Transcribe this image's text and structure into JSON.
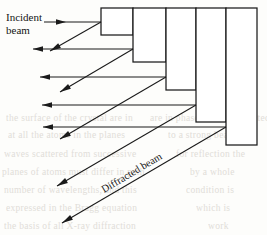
{
  "figure": {
    "type": "diffraction-schematic",
    "width": 267,
    "height": 235,
    "background_color": "#fdfdfb",
    "line_color": "#1a1a1a"
  },
  "labels": {
    "incident_line1": "Incident",
    "incident_line2": "beam",
    "diffracted": "Diffracted beam"
  },
  "crystal_steps": [
    {
      "name": "step-1",
      "x": 101,
      "y": 8,
      "width": 32,
      "height": 27
    },
    {
      "name": "step-2",
      "x": 133,
      "y": 8,
      "width": 33,
      "height": 54
    },
    {
      "name": "step-3",
      "x": 166,
      "y": 8,
      "width": 30,
      "height": 82
    },
    {
      "name": "step-4",
      "x": 196,
      "y": 8,
      "width": 30,
      "height": 114
    },
    {
      "name": "step-5",
      "x": 226,
      "y": 8,
      "width": 31,
      "height": 137
    }
  ],
  "step_corners": [
    {
      "x": 101,
      "y": 22
    },
    {
      "x": 133,
      "y": 49
    },
    {
      "x": 166,
      "y": 77
    },
    {
      "x": 196,
      "y": 105
    },
    {
      "x": 226,
      "y": 127
    }
  ],
  "incident_rays": [
    {
      "name": "incident-ray-1",
      "x1": 44,
      "y1": 22,
      "x2": 101,
      "y2": 22,
      "arrow": "right"
    },
    {
      "name": "incident-ray-2",
      "x1": 33,
      "y1": 49,
      "x2": 133,
      "y2": 49,
      "arrow": "left"
    },
    {
      "name": "incident-ray-3",
      "x1": 40,
      "y1": 77,
      "x2": 166,
      "y2": 77,
      "arrow": "left"
    },
    {
      "name": "incident-ray-4",
      "x1": 42,
      "y1": 105,
      "x2": 196,
      "y2": 105,
      "arrow": "left"
    },
    {
      "name": "incident-ray-5",
      "x1": 43,
      "y1": 127,
      "x2": 226,
      "y2": 127,
      "arrow": "left"
    }
  ],
  "diffracted_rays": [
    {
      "name": "diffracted-ray-1",
      "x1": 101,
      "y1": 22,
      "x2": 50,
      "y2": 51,
      "arrow": "down-left"
    },
    {
      "name": "diffracted-ray-2",
      "x1": 133,
      "y1": 49,
      "x2": 60,
      "y2": 92,
      "arrow": "down-left"
    },
    {
      "name": "diffracted-ray-3",
      "x1": 166,
      "y1": 77,
      "x2": 60,
      "y2": 139,
      "arrow": "down-left"
    },
    {
      "name": "diffracted-ray-4",
      "x1": 196,
      "y1": 105,
      "x2": 57,
      "y2": 186,
      "arrow": "down-left"
    },
    {
      "name": "diffracted-ray-5",
      "x1": 226,
      "y1": 127,
      "x2": 62,
      "y2": 223,
      "arrow": "down-left"
    }
  ],
  "background_bleed_text": [
    {
      "text": "the surface of the crystal are in",
      "x": 6,
      "y": 113
    },
    {
      "text": "are in phase and the reflected",
      "x": 150,
      "y": 113
    },
    {
      "text": "at all the atoms in the planes",
      "x": 8,
      "y": 130
    },
    {
      "text": "to a strong beam of",
      "x": 168,
      "y": 130
    },
    {
      "text": "waves scattered from successive",
      "x": 4,
      "y": 149
    },
    {
      "text": "for reflection the",
      "x": 176,
      "y": 149
    },
    {
      "text": "planes of atoms must differ in path",
      "x": 2,
      "y": 167
    },
    {
      "text": "by a whole",
      "x": 190,
      "y": 167
    },
    {
      "text": "number of wavelengths, and this",
      "x": 4,
      "y": 185
    },
    {
      "text": "condition is",
      "x": 186,
      "y": 185
    },
    {
      "text": "expressed in the Bragg equation",
      "x": 6,
      "y": 203
    },
    {
      "text": "which is",
      "x": 196,
      "y": 203
    },
    {
      "text": "the basis of all X-ray diffraction",
      "x": 4,
      "y": 221
    },
    {
      "text": "work",
      "x": 208,
      "y": 221
    }
  ]
}
